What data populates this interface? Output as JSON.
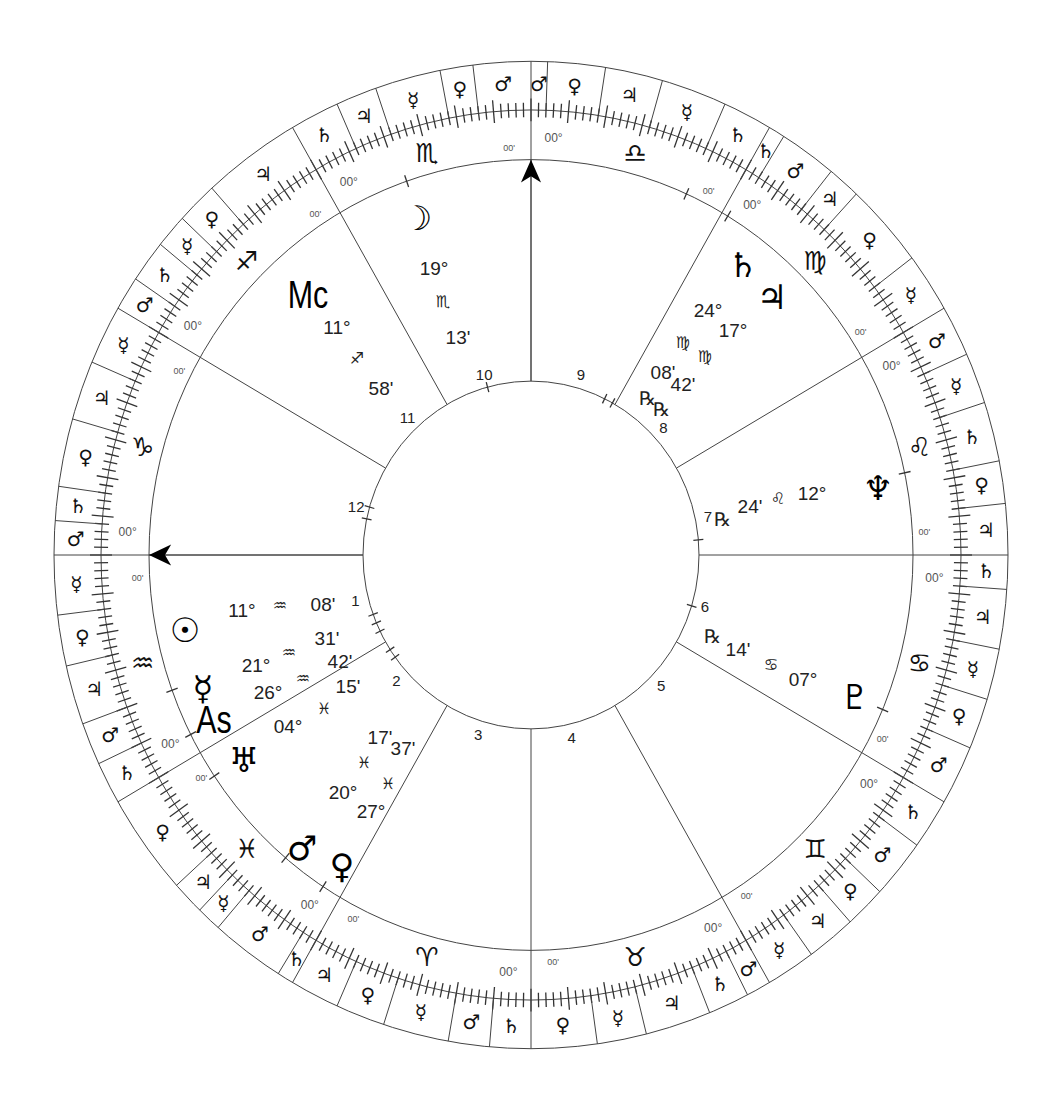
{
  "chart": {
    "type": "natal-wheel",
    "center": [
      531,
      555
    ],
    "scale_y": 1.035,
    "radii": {
      "outer": 477,
      "ticks": 430,
      "zodiac_inner": 382,
      "inner": 168
    },
    "house_system": "equal",
    "sign_label_degree": "00°",
    "sign_label_minute": "00'",
    "signs": [
      {
        "name": "Aquarius",
        "glyph": "♒"
      },
      {
        "name": "Pisces",
        "glyph": "♓"
      },
      {
        "name": "Aries",
        "glyph": "♈"
      },
      {
        "name": "Taurus",
        "glyph": "♉"
      },
      {
        "name": "Gemini",
        "glyph": "♊"
      },
      {
        "name": "Cancer",
        "glyph": "♋"
      },
      {
        "name": "Leo",
        "glyph": "♌"
      },
      {
        "name": "Virgo",
        "glyph": "♍"
      },
      {
        "name": "Libra",
        "glyph": "♎"
      },
      {
        "name": "Scorpio",
        "glyph": "♏"
      },
      {
        "name": "Sagittarius",
        "glyph": "♐"
      },
      {
        "name": "Capricorn",
        "glyph": "♑"
      }
    ],
    "terms": {
      "Aquarius": [
        [
          "☿",
          7
        ],
        [
          "♀",
          6
        ],
        [
          "♃",
          7
        ],
        [
          "♂",
          5
        ],
        [
          "♄",
          5
        ]
      ],
      "Pisces": [
        [
          "♀",
          12
        ],
        [
          "♃",
          4
        ],
        [
          "☿",
          3
        ],
        [
          "♂",
          9
        ],
        [
          "♄",
          2
        ]
      ],
      "Aries": [
        [
          "♃",
          6
        ],
        [
          "♀",
          6
        ],
        [
          "☿",
          8
        ],
        [
          "♂",
          5
        ],
        [
          "♄",
          5
        ]
      ],
      "Taurus": [
        [
          "♀",
          8
        ],
        [
          "☿",
          6
        ],
        [
          "♃",
          8
        ],
        [
          "♄",
          5
        ],
        [
          "♂",
          3
        ]
      ],
      "Gemini": [
        [
          "☿",
          6
        ],
        [
          "♃",
          6
        ],
        [
          "♀",
          5
        ],
        [
          "♂",
          7
        ],
        [
          "♄",
          6
        ]
      ],
      "Cancer": [
        [
          "♂",
          7
        ],
        [
          "♀",
          6
        ],
        [
          "☿",
          6
        ],
        [
          "♃",
          7
        ],
        [
          "♄",
          4
        ]
      ],
      "Leo": [
        [
          "♃",
          6
        ],
        [
          "♀",
          5
        ],
        [
          "♄",
          7
        ],
        [
          "☿",
          6
        ],
        [
          "♂",
          6
        ]
      ],
      "Virgo": [
        [
          "☿",
          7
        ],
        [
          "♀",
          10
        ],
        [
          "♃",
          4
        ],
        [
          "♂",
          7
        ],
        [
          "♄",
          2
        ]
      ],
      "Libra": [
        [
          "♄",
          6
        ],
        [
          "☿",
          8
        ],
        [
          "♃",
          7
        ],
        [
          "♀",
          7
        ],
        [
          "♂",
          2
        ]
      ],
      "Scorpio": [
        [
          "♂",
          7
        ],
        [
          "♀",
          4
        ],
        [
          "☿",
          8
        ],
        [
          "♃",
          5
        ],
        [
          "♄",
          6
        ]
      ],
      "Sagittarius": [
        [
          "♃",
          12
        ],
        [
          "♀",
          5
        ],
        [
          "☿",
          4
        ],
        [
          "♄",
          5
        ],
        [
          "♂",
          4
        ]
      ],
      "Capricorn": [
        [
          "☿",
          7
        ],
        [
          "♃",
          7
        ],
        [
          "♀",
          8
        ],
        [
          "♄",
          4
        ],
        [
          "♂",
          4
        ]
      ]
    },
    "houses": [
      {
        "number": "1",
        "label_angle": 194
      },
      {
        "number": "2",
        "label_angle": 222
      },
      {
        "number": "3",
        "label_angle": 253
      },
      {
        "number": "4",
        "label_angle": 283
      },
      {
        "number": "5",
        "label_angle": 316
      },
      {
        "number": "6",
        "label_angle": 344
      },
      {
        "number": "7",
        "label_angle": 12
      },
      {
        "number": "8",
        "label_angle": 43
      },
      {
        "number": "9",
        "label_angle": 74
      },
      {
        "number": "10",
        "label_angle": 105
      },
      {
        "number": "11",
        "label_angle": 133
      },
      {
        "number": "12",
        "label_angle": 165
      }
    ],
    "angles": [
      {
        "name": "Asc",
        "label": "As",
        "arrow_angle": 180,
        "pos": [
          214,
          720
        ]
      },
      {
        "name": "MC",
        "label": "Mc",
        "arrow_angle": 90,
        "pos": [
          308,
          295
        ]
      }
    ],
    "planets": [
      {
        "name": "Sun",
        "glyph": "☉",
        "sign": "♒",
        "deg": "11°",
        "min": "08'",
        "retro": false,
        "glyph_pos": [
          185,
          630
        ],
        "deg_pos": [
          242,
          610
        ],
        "sign_pos": [
          280,
          605
        ],
        "min_pos": [
          323,
          604
        ],
        "marker_angle": 200
      },
      {
        "name": "Mercury",
        "glyph": "☿",
        "sign": "♒",
        "deg": "21°",
        "min": "31'",
        "retro": false,
        "glyph_pos": [
          203,
          688
        ],
        "deg_pos": [
          256,
          665
        ],
        "sign_pos": [
          289,
          652
        ],
        "min_pos": [
          327,
          638
        ],
        "marker_angle": 207
      },
      {
        "name": "Uranus",
        "glyph": "♅",
        "sign": "♓",
        "deg": "04°",
        "min": "15'",
        "retro": false,
        "glyph_pos": [
          244,
          760
        ],
        "deg_pos": [
          288,
          726
        ],
        "sign_pos": [
          324,
          708
        ],
        "min_pos": [
          348,
          686
        ],
        "marker_angle": 214
      },
      {
        "name": "Venus2",
        "glyph": "",
        "sign": "♒",
        "deg": "26°",
        "min": "42'",
        "retro": false,
        "glyph_pos": [
          0,
          0
        ],
        "deg_pos": [
          268,
          692
        ],
        "sign_pos": [
          303,
          678
        ],
        "min_pos": [
          340,
          661
        ],
        "marker_angle": 0
      },
      {
        "name": "Mars",
        "glyph": "♂",
        "sign": "♓",
        "deg": "20°",
        "min": "17'",
        "retro": false,
        "glyph_pos": [
          302,
          848
        ],
        "deg_pos": [
          343,
          792
        ],
        "sign_pos": [
          364,
          762
        ],
        "min_pos": [
          380,
          737
        ],
        "marker_angle": 230
      },
      {
        "name": "Venus",
        "glyph": "♀",
        "sign": "♓",
        "deg": "27°",
        "min": "37'",
        "retro": false,
        "glyph_pos": [
          342,
          866
        ],
        "deg_pos": [
          371,
          811
        ],
        "sign_pos": [
          388,
          783
        ],
        "min_pos": [
          403,
          748
        ],
        "marker_angle": 237
      },
      {
        "name": "Moon",
        "glyph": "☽",
        "sign": "♏",
        "deg": "19°",
        "min": "13'",
        "retro": false,
        "glyph_pos": [
          417,
          218
        ],
        "deg_pos": [
          434,
          268
        ],
        "sign_pos": [
          443,
          301
        ],
        "min_pos": [
          458,
          337
        ],
        "marker_angle": 109
      },
      {
        "name": "Saturn",
        "glyph": "♄",
        "sign": "♍",
        "deg": "24°",
        "min": "08'",
        "retro": true,
        "glyph_pos": [
          743,
          265
        ],
        "deg_pos": [
          708,
          310
        ],
        "sign_pos": [
          683,
          342
        ],
        "min_pos": [
          663,
          372
        ],
        "retro_pos": [
          647,
          398
        ],
        "marker_angle": 66
      },
      {
        "name": "Jupiter",
        "glyph": "♃",
        "sign": "♍",
        "deg": "17°",
        "min": "42'",
        "retro": true,
        "glyph_pos": [
          772,
          297
        ],
        "deg_pos": [
          733,
          330
        ],
        "sign_pos": [
          705,
          356
        ],
        "min_pos": [
          683,
          384
        ],
        "retro_pos": [
          661,
          409
        ],
        "marker_angle": 59
      },
      {
        "name": "Neptune",
        "glyph": "♆",
        "sign": "♌",
        "deg": "12°",
        "min": "24'",
        "retro": true,
        "glyph_pos": [
          878,
          488
        ],
        "deg_pos": [
          812,
          493
        ],
        "sign_pos": [
          778,
          498
        ],
        "min_pos": [
          750,
          506
        ],
        "retro_pos": [
          722,
          519
        ],
        "marker_angle": 12
      },
      {
        "name": "Pluto",
        "glyph": "♇",
        "sign": "♋",
        "deg": "07°",
        "min": "14'",
        "retro": true,
        "glyph_pos": [
          855,
          697
        ],
        "deg_pos": [
          803,
          679
        ],
        "sign_pos": [
          771,
          664
        ],
        "min_pos": [
          738,
          649
        ],
        "retro_pos": [
          712,
          636
        ],
        "marker_angle": 337
      }
    ],
    "retrograde_symbol": "℞",
    "inner_markers": [
      164,
      168,
      200,
      203,
      206,
      213,
      216,
      64,
      61,
      5,
      343,
      105
    ]
  }
}
